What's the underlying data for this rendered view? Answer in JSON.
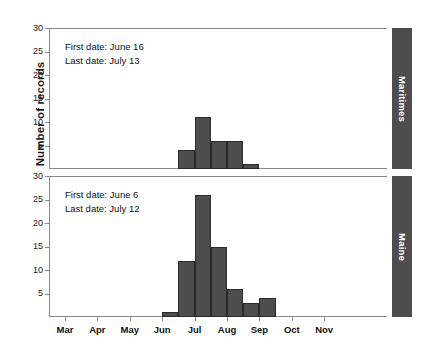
{
  "chart_data": {
    "type": "bar",
    "title": "",
    "xlabel": "",
    "ylabel": "Number of records",
    "ylim": [
      0,
      30
    ],
    "yticks": [
      0,
      5,
      10,
      15,
      20,
      25,
      30
    ],
    "ytick_labels_shown": [
      "5",
      "10",
      "15",
      "20",
      "25",
      "30"
    ],
    "grid": false,
    "legend": false,
    "xtick_labels": [
      "Mar",
      "Apr",
      "May",
      "Jun",
      "Jul",
      "Aug",
      "Sep",
      "Oct",
      "Nov"
    ],
    "x_axis_note": "half-month bins; month tick marks between labels",
    "panels": [
      {
        "strip_label": "Maritimes",
        "annotations": [
          "First date: June 16",
          "Last date: July 13"
        ],
        "bins": [
          "Jun 2nd half",
          "Jul 1st half A",
          "Jul 1st half B",
          "Jul 2nd half A",
          "Jul 2nd half B"
        ],
        "values": [
          4,
          11,
          6,
          6,
          1
        ]
      },
      {
        "strip_label": "Maine",
        "annotations": [
          "First date: June 6",
          "Last date: July 12"
        ],
        "bins": [
          "Jun A",
          "Jun B",
          "Jun C",
          "Jul A",
          "Jul B",
          "Jul C",
          "Jul D"
        ],
        "values": [
          1,
          12,
          26,
          15,
          6,
          3,
          4
        ]
      }
    ],
    "colors": {
      "bar_fill": "#4d4d4d",
      "bar_edge": "#2b2b2b",
      "strip_fill": "#4d4d4d",
      "strip_text": "#ffffff",
      "axis": "#8a8a8a",
      "text": "#111111",
      "background": "#ffffff"
    }
  },
  "axis": {
    "y_title": "Number of records",
    "y_ticks": [
      "30",
      "25",
      "20",
      "15",
      "10",
      "5"
    ],
    "x_ticks": [
      "Mar",
      "Apr",
      "May",
      "Jun",
      "Jul",
      "Aug",
      "Sep",
      "Oct",
      "Nov"
    ]
  },
  "panel_top": {
    "strip_label": "Maritimes",
    "first_date": "First date: June 16",
    "last_date": "Last date: July 13"
  },
  "panel_bottom": {
    "strip_label": "Maine",
    "first_date": "First date: June 6",
    "last_date": "Last date: July 12"
  }
}
